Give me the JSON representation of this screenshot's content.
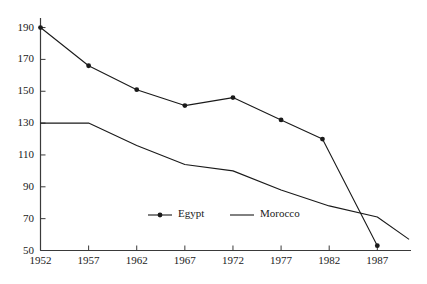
{
  "chart_data": {
    "type": "line",
    "title": "",
    "subtitle": "",
    "xlabel": "",
    "ylabel": "",
    "x": [
      1952,
      1957,
      1962,
      1967,
      1972,
      1977,
      1982,
      1987
    ],
    "xtick_labels": [
      "1952",
      "1957",
      "1962",
      "1967",
      "1972",
      "1977",
      "1982",
      "1987"
    ],
    "ytick_labels": [
      "190",
      "170",
      "150",
      "130",
      "110",
      "90",
      "70",
      "50"
    ],
    "yticks": [
      190,
      170,
      150,
      130,
      110,
      90,
      70,
      50
    ],
    "xlim": [
      1952,
      1990.5
    ],
    "ylim": [
      50,
      196
    ],
    "grid": false,
    "legend_position": "inside-bottom-center",
    "series": [
      {
        "name": "Egypt",
        "marker": "filled-circle",
        "line_color": "#1a1a1a",
        "x": [
          1952,
          1957,
          1962,
          1967,
          1972,
          1977,
          1981.3,
          1987
        ],
        "values": [
          190,
          166,
          151,
          141,
          146,
          132,
          120,
          53
        ]
      },
      {
        "name": "Morocco",
        "marker": "none",
        "line_color": "#1a1a1a",
        "x": [
          1952,
          1957,
          1962,
          1967,
          1972,
          1977,
          1982,
          1987,
          1990.3
        ],
        "values": [
          130,
          130,
          116,
          104,
          100,
          88,
          78,
          71,
          57
        ]
      }
    ],
    "legend": [
      {
        "label": "Egypt",
        "marker": "filled-circle",
        "line": true
      },
      {
        "label": "Morocco",
        "marker": "none",
        "line": true
      }
    ]
  },
  "axis": {
    "axis_color": "#3a3a3a",
    "tick_color": "#3a3a3a"
  }
}
